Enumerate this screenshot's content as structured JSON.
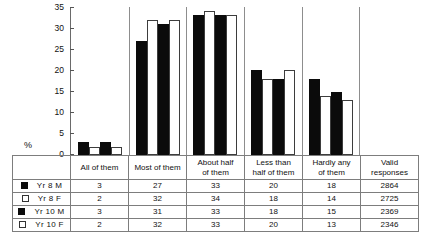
{
  "chart_data": {
    "type": "bar",
    "title": "",
    "subtitle": "",
    "xlabel": "",
    "ylabel": "%",
    "ylim": [
      0,
      35
    ],
    "yticks": [
      0,
      5,
      10,
      15,
      20,
      25,
      30,
      35
    ],
    "grid": false,
    "legend_position": "table-left",
    "categories": [
      "All of them",
      "Most of them",
      "About half of them",
      "Less than half of them",
      "Hardly any of them"
    ],
    "series": [
      {
        "name": "Yr 8 M",
        "color": "#0b0b0b",
        "swatch": "black",
        "values": [
          3,
          27,
          33,
          20,
          18
        ],
        "valid_responses": 2864
      },
      {
        "name": "Yr 8 F",
        "color": "#ffffff",
        "swatch": "white",
        "values": [
          2,
          32,
          34,
          18,
          14
        ],
        "valid_responses": 2725
      },
      {
        "name": "Yr 10 M",
        "color": "#0b0b0b",
        "swatch": "black",
        "values": [
          3,
          31,
          33,
          18,
          15
        ],
        "valid_responses": 2369
      },
      {
        "name": "Yr 10 F",
        "color": "#ffffff",
        "swatch": "white",
        "values": [
          2,
          32,
          33,
          20,
          13
        ],
        "valid_responses": 2346
      }
    ]
  },
  "axis": {
    "percent_symbol": "%",
    "ticks": [
      "35",
      "30",
      "25",
      "20",
      "15",
      "10",
      "5",
      "0"
    ]
  },
  "table": {
    "legend_header": "",
    "headers": [
      {
        "line1": "All of them",
        "line2": ""
      },
      {
        "line1": "Most of them",
        "line2": ""
      },
      {
        "line1": "About half",
        "line2": "of them"
      },
      {
        "line1": "Less than",
        "line2": "half of them"
      },
      {
        "line1": "Hardly any",
        "line2": "of them"
      },
      {
        "line1": "Valid",
        "line2": "responses"
      }
    ],
    "rows": [
      {
        "label": "Yr 8 M",
        "swatch": "black",
        "cells": [
          "3",
          "27",
          "33",
          "20",
          "18",
          "2864"
        ]
      },
      {
        "label": "Yr 8 F",
        "swatch": "white",
        "cells": [
          "2",
          "32",
          "34",
          "18",
          "14",
          "2725"
        ]
      },
      {
        "label": "Yr 10 M",
        "swatch": "black",
        "cells": [
          "3",
          "31",
          "33",
          "18",
          "15",
          "2369"
        ]
      },
      {
        "label": "Yr 10 F",
        "swatch": "white",
        "cells": [
          "2",
          "32",
          "33",
          "20",
          "13",
          "2346"
        ]
      }
    ]
  }
}
